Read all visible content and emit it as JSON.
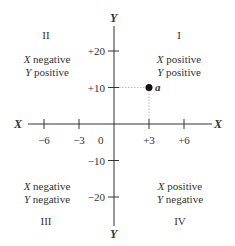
{
  "diagram": {
    "axes": {
      "x_label": "X",
      "y_label": "Y",
      "origin_label": "0"
    },
    "x_ticks": [
      {
        "value": -6,
        "label": "−6"
      },
      {
        "value": -3,
        "label": "−3"
      },
      {
        "value": 3,
        "label": "+3"
      },
      {
        "value": 6,
        "label": "+6"
      }
    ],
    "y_ticks": [
      {
        "value": 20,
        "label": "+20"
      },
      {
        "value": 10,
        "label": "+10"
      },
      {
        "value": -10,
        "label": "−10"
      },
      {
        "value": -20,
        "label": "−20"
      }
    ],
    "quadrants": [
      {
        "numeral": "I",
        "x_var": "X",
        "x_sign": "positive",
        "y_var": "Y",
        "y_sign": "positive"
      },
      {
        "numeral": "II",
        "x_var": "X",
        "x_sign": "negative",
        "y_var": "Y",
        "y_sign": "positive"
      },
      {
        "numeral": "III",
        "x_var": "X",
        "x_sign": "negative",
        "y_var": "Y",
        "y_sign": "negative"
      },
      {
        "numeral": "IV",
        "x_var": "X",
        "x_sign": "positive",
        "y_var": "Y",
        "y_sign": "negative"
      }
    ],
    "point": {
      "label": "a",
      "x": 3,
      "y": 10
    },
    "colors": {
      "ink": "#333333",
      "guide": "#bbbbbb"
    }
  }
}
